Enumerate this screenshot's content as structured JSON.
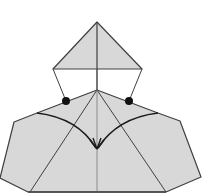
{
  "diagram": {
    "type": "origami-fold-step",
    "colors": {
      "paper": "#d8d8d8",
      "line": "#404040",
      "crease": "#7a7a7a",
      "arrow": "#1a1a1a",
      "dot": "#111111",
      "background": "#ffffff"
    },
    "top_flap": {
      "points": [
        [
          97,
          22
        ],
        [
          53,
          69
        ],
        [
          142,
          69
        ]
      ]
    },
    "body": {
      "points": [
        [
          97,
          90
        ],
        [
          37,
          113
        ],
        [
          14,
          122
        ],
        [
          0,
          178
        ],
        [
          28,
          192
        ],
        [
          166,
          192
        ],
        [
          201,
          177
        ],
        [
          180,
          121
        ],
        [
          158,
          113
        ]
      ]
    },
    "connectors": [
      {
        "from": [
          53,
          69
        ],
        "to": [
          66,
          101
        ]
      },
      {
        "from": [
          142,
          69
        ],
        "to": [
          129,
          101
        ]
      }
    ],
    "reference_dots": [
      {
        "cx": 66,
        "cy": 101,
        "r": 4
      },
      {
        "cx": 129,
        "cy": 101,
        "r": 4
      }
    ],
    "creases": [
      {
        "from": [
          97,
          22
        ],
        "to": [
          97,
          192
        ],
        "name": "center-crease"
      },
      {
        "from": [
          97,
          90
        ],
        "to": [
          30,
          192
        ],
        "name": "left-diagonal"
      },
      {
        "from": [
          97,
          90
        ],
        "to": [
          166,
          192
        ],
        "name": "right-diagonal"
      }
    ],
    "fold_arrows": [
      {
        "name": "left-fold-arrow",
        "path": "M37,113 Q78,118 96,148"
      },
      {
        "name": "right-fold-arrow",
        "path": "M158,113 Q117,118 98,148"
      }
    ],
    "arrow_tip": [
      97,
      149
    ]
  }
}
